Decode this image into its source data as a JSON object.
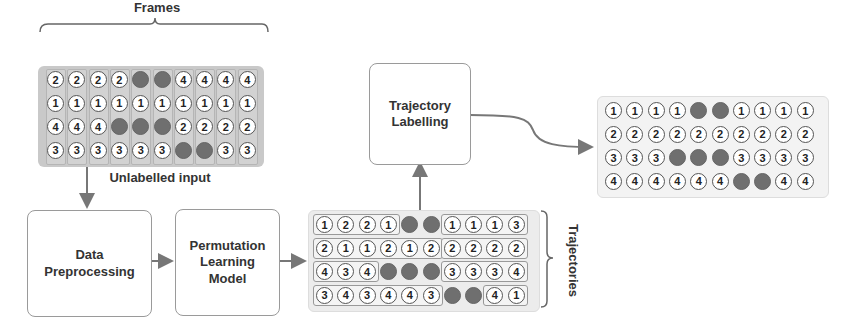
{
  "labels": {
    "frames": "Frames",
    "unlabelled_input": "Unlabelled input",
    "data_preprocessing": "Data Preprocessing",
    "permutation_learning_model": "Permutation Learning Model",
    "trajectory_labelling": "Trajectory Labelling",
    "trajectories": "Trajectories"
  },
  "colors": {
    "occluded_dot": "#6f6f6f",
    "input_panel": "#c9c9c9",
    "trajectory_panel": "#ececec",
    "arrow": "#777777"
  },
  "unlabelled_input_grid": [
    [
      "2",
      "2",
      "2",
      "2",
      "x",
      "x",
      "4",
      "4",
      "4",
      "4"
    ],
    [
      "1",
      "1",
      "1",
      "1",
      "1",
      "1",
      "1",
      "1",
      "1",
      "1"
    ],
    [
      "4",
      "4",
      "4",
      "x",
      "x",
      "x",
      "2",
      "2",
      "2",
      "2"
    ],
    [
      "3",
      "3",
      "3",
      "3",
      "3",
      "3",
      "x",
      "x",
      "3",
      "3"
    ]
  ],
  "trajectories_grid": [
    [
      "1",
      "2",
      "2",
      "1",
      "x",
      "x",
      "1",
      "1",
      "1",
      "3"
    ],
    [
      "2",
      "1",
      "1",
      "2",
      "1",
      "2",
      "2",
      "2",
      "2",
      "2"
    ],
    [
      "4",
      "3",
      "4",
      "x",
      "x",
      "x",
      "3",
      "3",
      "3",
      "4"
    ],
    [
      "3",
      "4",
      "3",
      "4",
      "4",
      "3",
      "x",
      "x",
      "4",
      "1"
    ]
  ],
  "trajectory_groups": [
    [
      [
        0,
        3
      ],
      [
        6,
        9
      ]
    ],
    [
      [
        0,
        5
      ],
      [
        6,
        9
      ]
    ],
    [
      [
        0,
        2
      ],
      [
        6,
        9
      ]
    ],
    [
      [
        0,
        5
      ],
      [
        8,
        9
      ]
    ]
  ],
  "labelled_output_grid": [
    [
      "1",
      "1",
      "1",
      "1",
      "x",
      "x",
      "1",
      "1",
      "1",
      "1"
    ],
    [
      "2",
      "2",
      "2",
      "2",
      "2",
      "2",
      "2",
      "2",
      "2",
      "2"
    ],
    [
      "3",
      "3",
      "3",
      "x",
      "x",
      "x",
      "3",
      "3",
      "3",
      "3"
    ],
    [
      "4",
      "4",
      "4",
      "4",
      "4",
      "4",
      "x",
      "x",
      "4",
      "4"
    ]
  ]
}
